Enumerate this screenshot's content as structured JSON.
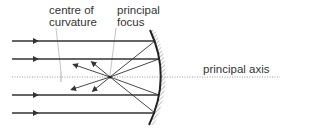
{
  "labels": {
    "centre_line1": "centre of",
    "centre_line2": "curvature",
    "focus_line1": "principal",
    "focus_line2": "focus",
    "axis": "principal axis"
  },
  "colors": {
    "ray": "#333333",
    "axis": "#999999",
    "mirror": "#222222",
    "hatch": "#888888",
    "text": "#333333"
  },
  "geometry": {
    "principal_axis_y": 77,
    "focus": [
      110,
      77
    ],
    "centre_of_curvature": [
      60,
      77
    ],
    "incident_ray_ys": [
      41,
      59,
      95,
      113
    ],
    "mirror": {
      "top": [
        150,
        30
      ],
      "apex": [
        161,
        77
      ],
      "bottom": [
        149,
        125
      ]
    }
  }
}
